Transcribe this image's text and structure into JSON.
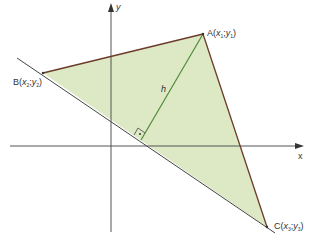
{
  "diagram": {
    "type": "coordinate-geometry",
    "axes": {
      "x_label": "x",
      "y_label": "y",
      "origin_px": [
        111,
        146
      ],
      "color": "#555555"
    },
    "vertices": {
      "A": {
        "name": "A",
        "x": "x",
        "y": "y",
        "sub": "1",
        "px": [
          203,
          34
        ]
      },
      "B": {
        "name": "B",
        "x": "x",
        "y": "y",
        "sub": "2",
        "px": [
          43,
          73
        ]
      },
      "C": {
        "name": "C",
        "x": "x",
        "y": "y",
        "sub": "3",
        "px": [
          267,
          227
        ]
      }
    },
    "altitude": {
      "label": "h",
      "from": "A",
      "to_side": "BC",
      "foot_px": [
        141,
        140
      ],
      "right_angle_marker": true
    },
    "colors": {
      "fill": "#dde9c4",
      "triangle_edge": "#6b3b2a",
      "altitude": "#4f8a3a",
      "extension_line": "#444444"
    }
  }
}
